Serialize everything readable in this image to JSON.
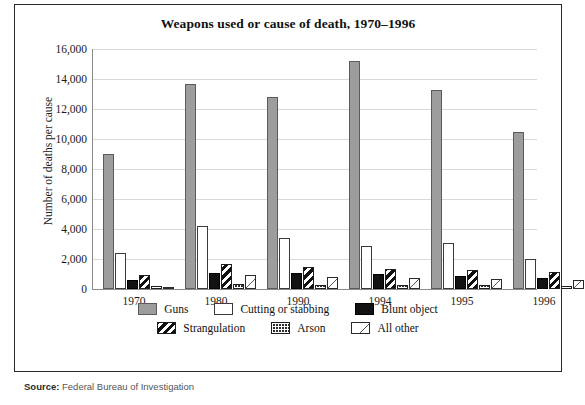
{
  "chart_data": {
    "type": "bar",
    "title": "Weapons used or cause of death, 1970–1996",
    "xlabel": "",
    "ylabel": "Number of deaths per cause",
    "categories": [
      "1970",
      "1980",
      "1990",
      "1994",
      "1995",
      "1996"
    ],
    "ylim": [
      0,
      16000
    ],
    "ytick_step": 2000,
    "yticks": [
      "16,000",
      "14,000",
      "12,000",
      "10,000",
      "8,000",
      "6,000",
      "4,000",
      "2,000",
      "0"
    ],
    "grid": true,
    "legend_position": "bottom",
    "series": [
      {
        "name": "Guns",
        "color": "#9d9d9d",
        "pattern": "solid-gray",
        "values": [
          9000,
          13700,
          12800,
          15200,
          13300,
          10500
        ]
      },
      {
        "name": "Cutting or stabbing",
        "color": "#ffffff",
        "pattern": "solid-white",
        "values": [
          2400,
          4200,
          3400,
          2900,
          3100,
          2000
        ]
      },
      {
        "name": "Blunt object",
        "color": "#121212",
        "pattern": "solid-black",
        "values": [
          600,
          1100,
          1050,
          1000,
          900,
          750
        ]
      },
      {
        "name": "Strangulation",
        "color": "#111111",
        "pattern": "diagonal-stripes",
        "values": [
          950,
          1700,
          1450,
          1350,
          1250,
          1150
        ]
      },
      {
        "name": "Arson",
        "color": "#2b2b2b",
        "pattern": "brick-dots",
        "values": [
          200,
          350,
          300,
          300,
          280,
          230
        ]
      },
      {
        "name": "All other",
        "color": "#ffffff",
        "pattern": "sparse-diagonal",
        "values": [
          100,
          950,
          800,
          750,
          700,
          600
        ]
      }
    ]
  },
  "source": {
    "label": "Source:",
    "text": "Federal Bureau of Investigation"
  }
}
